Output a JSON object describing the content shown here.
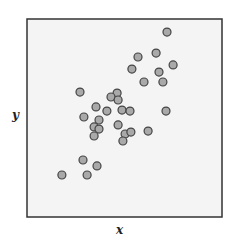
{
  "chart_data": {
    "type": "scatter",
    "title": "",
    "xlabel": "x",
    "ylabel": "y",
    "xlim": [
      0,
      1
    ],
    "ylim": [
      0,
      1
    ],
    "grid": false,
    "legend": null,
    "ticks": "none",
    "series": [
      {
        "name": "points",
        "x": [
          0.718,
          0.662,
          0.569,
          0.749,
          0.538,
          0.677,
          0.6,
          0.697,
          0.272,
          0.462,
          0.431,
          0.467,
          0.354,
          0.41,
          0.487,
          0.528,
          0.713,
          0.292,
          0.369,
          0.344,
          0.369,
          0.467,
          0.344,
          0.503,
          0.533,
          0.621,
          0.492,
          0.287,
          0.359,
          0.179,
          0.308
        ],
        "y": [
          0.934,
          0.828,
          0.808,
          0.768,
          0.747,
          0.732,
          0.682,
          0.682,
          0.631,
          0.626,
          0.606,
          0.591,
          0.556,
          0.535,
          0.54,
          0.535,
          0.535,
          0.505,
          0.49,
          0.455,
          0.444,
          0.465,
          0.409,
          0.419,
          0.429,
          0.434,
          0.384,
          0.288,
          0.258,
          0.212,
          0.212
        ]
      }
    ]
  },
  "style": {
    "plot_background": "#f4f4f4",
    "frame_color": "#333333",
    "marker_fill": "#a9a9a9",
    "marker_stroke": "#444444",
    "marker_radius": 4
  },
  "labels": {
    "x": "x",
    "y": "y"
  }
}
